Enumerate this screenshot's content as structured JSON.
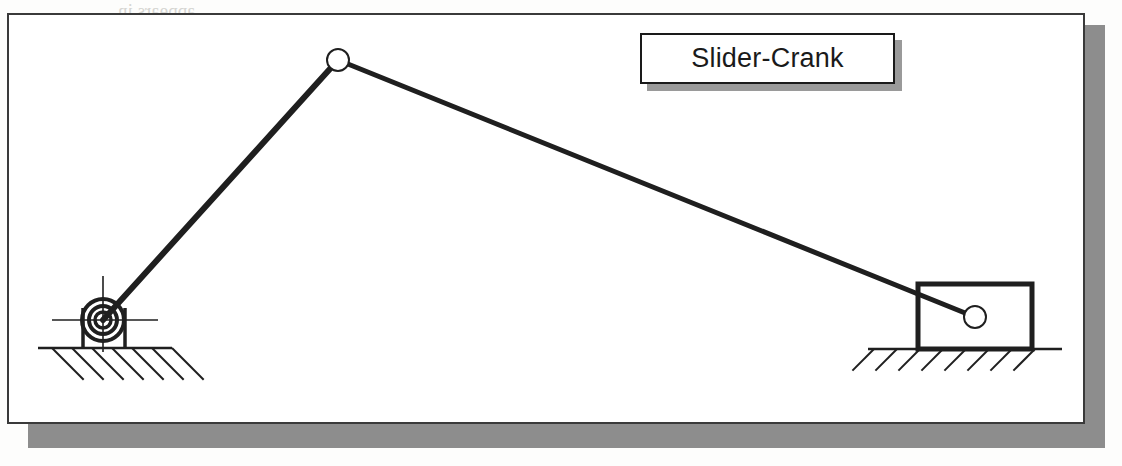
{
  "figure": {
    "kind": "mechanism-line-drawing",
    "title": "Slider-Crank",
    "background_artifacts": {
      "note": "faint mirrored show-through text from reverse of scanned page",
      "lines": [
        "appears in",
        "mechanism, the",
        "Crank-Rocker",
        "link that is fix"
      ],
      "watermark": "mechanism"
    },
    "frame": {
      "border_color": "#3a3a3a",
      "fill_color": "#ffffff",
      "shadow_color": "#8d8d8d"
    },
    "title_box": {
      "border_color": "#1a1a1a",
      "fill_color": "#ffffff",
      "shadow_color": "#9a9a9a",
      "text_color": "#1a1a1a"
    },
    "ink_color": "#1f1f1f",
    "joint_fill": "#ffffff"
  },
  "mechanism": {
    "name": "Slider-Crank",
    "links": [
      {
        "name": "crank",
        "from": "ground-pivot",
        "to": "crank-pin",
        "x1": 103,
        "y1": 320,
        "x2": 338,
        "y2": 60,
        "stroke_width": 6
      },
      {
        "name": "coupler",
        "from": "crank-pin",
        "to": "slider-pin",
        "x1": 338,
        "y1": 60,
        "x2": 975,
        "y2": 317,
        "stroke_width": 5
      }
    ],
    "joints": [
      {
        "name": "ground-pivot",
        "type": "bearing",
        "cx": 103,
        "cy": 320,
        "radii": [
          21,
          14,
          8
        ]
      },
      {
        "name": "crank-pin",
        "type": "pin",
        "cx": 338,
        "cy": 60,
        "r": 11
      },
      {
        "name": "slider-pin",
        "type": "pin",
        "cx": 975,
        "cy": 317,
        "r": 11
      }
    ],
    "slider": {
      "name": "slider-block",
      "x": 918,
      "y": 284,
      "width": 114,
      "height": 65,
      "stroke_width": 5
    },
    "grounds": [
      {
        "name": "ground-left",
        "line_x1": 38,
        "line_x2": 172,
        "line_y": 348,
        "hatch_direction": "down-right",
        "hatch_count": 7,
        "hatch_spacing": 20,
        "hatch_length": 44
      },
      {
        "name": "ground-right",
        "line_x1": 868,
        "line_x2": 1062,
        "line_y": 349,
        "hatch_direction": "down-left",
        "hatch_count": 8,
        "hatch_spacing": 23,
        "hatch_length": 30
      }
    ],
    "mount": {
      "name": "pivot-mount",
      "left_leg_x": 83,
      "right_leg_x": 125,
      "top_y": 308,
      "bottom_y": 348
    },
    "centerlines": {
      "name": "pivot-centerlines",
      "horizontal": {
        "x1": 52,
        "x2": 158,
        "y": 320
      },
      "vertical": {
        "x": 103,
        "y1": 276,
        "y2": 352
      }
    }
  }
}
